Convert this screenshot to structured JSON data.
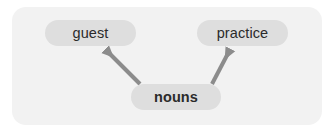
{
  "diagram": {
    "type": "concept-map",
    "panel": {
      "background_color": "#f2f2f2",
      "corner_radius": 14
    },
    "node_style": {
      "fill_color": "#dedede",
      "text_color": "#2b2b2b"
    },
    "arrow_style": {
      "color": "#8c8c8c",
      "stroke_width": 4,
      "head": "solid-triangle"
    },
    "nodes": [
      {
        "id": "guest",
        "label": "guest",
        "bold": false,
        "role": "target"
      },
      {
        "id": "practice",
        "label": "practice",
        "bold": false,
        "role": "target"
      },
      {
        "id": "nouns",
        "label": "nouns",
        "bold": true,
        "role": "source"
      }
    ],
    "edges": [
      {
        "id": "nouns-to-guest",
        "from": "nouns",
        "to": "guest",
        "direction": "up-left",
        "arrowhead_at": "guest"
      },
      {
        "id": "nouns-to-practice",
        "from": "nouns",
        "to": "practice",
        "direction": "up-right",
        "arrowhead_at": "practice"
      }
    ]
  }
}
